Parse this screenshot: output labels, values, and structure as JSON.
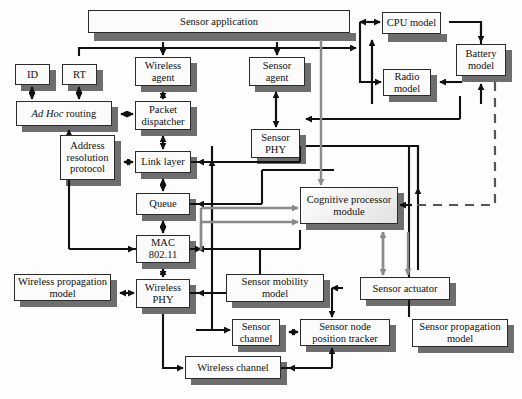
{
  "diagram": {
    "colors": {
      "box_fill": "#fbfbfb",
      "box_border": "#2b2b2b",
      "shadow": "#6e6e6e",
      "arrow_black": "#111111",
      "arrow_gray": "#8a8a8a",
      "dashed": "#555555"
    },
    "blocks": [
      {
        "id": "sensor_application",
        "label": "Sensor application",
        "x": 88,
        "y": 10,
        "w": 262,
        "h": 23
      },
      {
        "id": "cpu_model",
        "label": "CPU model",
        "x": 382,
        "y": 12,
        "w": 59,
        "h": 22
      },
      {
        "id": "battery_model",
        "label": "Battery model",
        "x": 456,
        "y": 44,
        "w": 50,
        "h": 32
      },
      {
        "id": "radio_model",
        "label": "Radio model",
        "x": 383,
        "y": 69,
        "w": 48,
        "h": 27
      },
      {
        "id": "id",
        "label": "ID",
        "x": 15,
        "y": 64,
        "w": 35,
        "h": 21
      },
      {
        "id": "rt",
        "label": "RT",
        "x": 62,
        "y": 64,
        "w": 35,
        "h": 21
      },
      {
        "id": "wireless_agent",
        "label": "Wireless agent",
        "x": 135,
        "y": 57,
        "w": 56,
        "h": 29
      },
      {
        "id": "sensor_agent",
        "label": "Sensor agent",
        "x": 249,
        "y": 57,
        "w": 56,
        "h": 29
      },
      {
        "id": "ad_hoc_routing",
        "label": "Ad Hoc routing",
        "x": 16,
        "y": 101,
        "w": 96,
        "h": 25,
        "italic_prefix": "Ad Hoc",
        "rest": " routing"
      },
      {
        "id": "packet_dispatcher",
        "label": "Packet dispatcher",
        "x": 135,
        "y": 101,
        "w": 56,
        "h": 29
      },
      {
        "id": "sensor_phy",
        "label": "Sensor PHY",
        "x": 251,
        "y": 129,
        "w": 49,
        "h": 29
      },
      {
        "id": "address_resolution",
        "label": "Address resolution protocol",
        "x": 60,
        "y": 135,
        "w": 55,
        "h": 45
      },
      {
        "id": "link_layer",
        "label": "Link layer",
        "x": 135,
        "y": 151,
        "w": 56,
        "h": 22
      },
      {
        "id": "cognitive_processor",
        "label": "Cognitive processor module",
        "x": 300,
        "y": 187,
        "w": 98,
        "h": 37,
        "gradient": true
      },
      {
        "id": "queue",
        "label": "Queue",
        "x": 136,
        "y": 193,
        "w": 54,
        "h": 22
      },
      {
        "id": "mac_802_11",
        "label": "MAC 802.11",
        "x": 136,
        "y": 235,
        "w": 54,
        "h": 28
      },
      {
        "id": "wireless_propagation",
        "label": "Wireless propagation model",
        "x": 14,
        "y": 274,
        "w": 97,
        "h": 27
      },
      {
        "id": "wireless_phy",
        "label": "Wireless PHY",
        "x": 136,
        "y": 279,
        "w": 54,
        "h": 29
      },
      {
        "id": "sensor_mobility",
        "label": "Sensor mobility model",
        "x": 226,
        "y": 274,
        "w": 98,
        "h": 28
      },
      {
        "id": "sensor_actuator",
        "label": "Sensor actuator",
        "x": 360,
        "y": 277,
        "w": 90,
        "h": 23
      },
      {
        "id": "sensor_channel",
        "label": "Sensor channel",
        "x": 232,
        "y": 319,
        "w": 48,
        "h": 27
      },
      {
        "id": "sensor_node_position",
        "label": "Sensor node position tracker",
        "x": 300,
        "y": 319,
        "w": 90,
        "h": 27
      },
      {
        "id": "sensor_propagation",
        "label": "Sensor propagation model",
        "x": 412,
        "y": 319,
        "w": 96,
        "h": 28
      },
      {
        "id": "wireless_channel",
        "label": "Wireless channel",
        "x": 185,
        "y": 356,
        "w": 96,
        "h": 23
      }
    ]
  }
}
